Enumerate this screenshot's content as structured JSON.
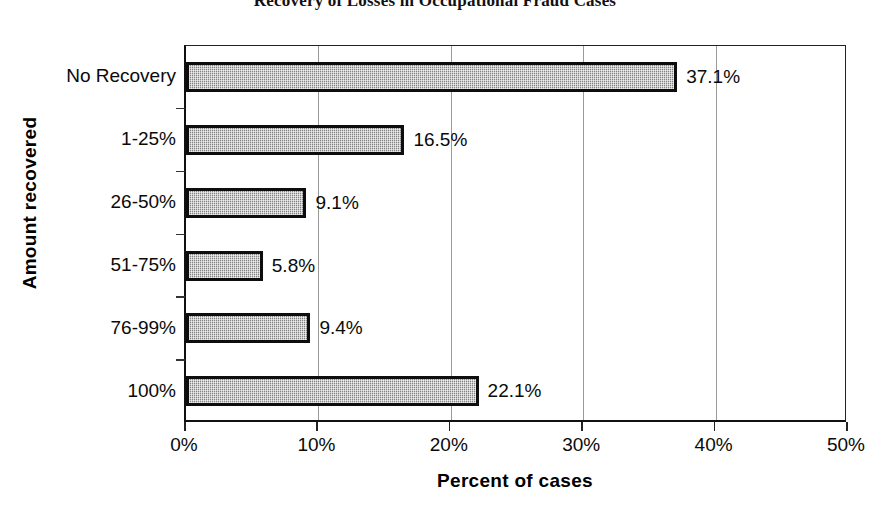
{
  "chart_data": {
    "type": "bar",
    "orientation": "horizontal",
    "title": "Recovery of Losses in Occupational Fraud Cases",
    "xlabel": "Percent of cases",
    "ylabel": "Amount recovered",
    "categories": [
      "No Recovery",
      "1-25%",
      "26-50%",
      "51-75%",
      "76-99%",
      "100%"
    ],
    "values": [
      37.1,
      16.5,
      9.1,
      5.8,
      9.4,
      22.1
    ],
    "data_labels": [
      "37.1%",
      "16.5%",
      "9.1%",
      "5.8%",
      "9.4%",
      "22.1%"
    ],
    "xlim": [
      0,
      50
    ],
    "xticks": [
      0,
      10,
      20,
      30,
      40,
      50
    ],
    "xtick_labels": [
      "0%",
      "10%",
      "20%",
      "30%",
      "40%",
      "50%"
    ],
    "grid": "vertical",
    "legend": null,
    "bar_fill_color": "#a9a9a9",
    "bar_edge_color": "#0d0d0d",
    "gridline_color": "#9a9a9a",
    "background_color": "#ffffff"
  }
}
